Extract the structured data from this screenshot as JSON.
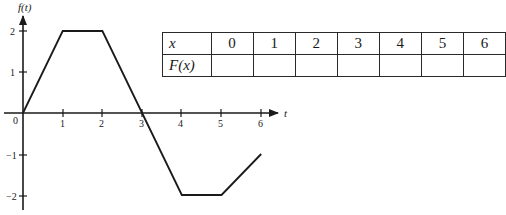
{
  "chart_data": {
    "type": "line",
    "title": "",
    "xlabel": "t",
    "ylabel": "f(t)",
    "x": [
      0,
      1,
      2,
      3,
      4,
      5,
      6
    ],
    "values": [
      0,
      2,
      2,
      0,
      -2,
      -2,
      -1
    ],
    "series": [
      {
        "name": "f(t)",
        "x": [
          0,
          1,
          2,
          3,
          4,
          5,
          6
        ],
        "values": [
          0,
          2,
          2,
          0,
          -2,
          -2,
          -1
        ]
      }
    ],
    "xlim": [
      0,
      6
    ],
    "ylim": [
      -2,
      2
    ],
    "x_ticks": [
      "0",
      "1",
      "2",
      "3",
      "4",
      "5",
      "6"
    ],
    "y_ticks": [
      "2",
      "1",
      "-1",
      "-2"
    ],
    "grid": false,
    "legend": null
  },
  "graph": {
    "y_axis_label": "f(t)",
    "x_axis_label": "t",
    "origin_label": "0",
    "x_tick_labels": [
      "1",
      "2",
      "3",
      "4",
      "5",
      "6"
    ],
    "y_tick_labels": {
      "p2": "2",
      "p1": "1",
      "n1": "−1",
      "n2": "−2"
    }
  },
  "table": {
    "row1_header": "x",
    "row2_header": "F(x)",
    "columns": [
      "0",
      "1",
      "2",
      "3",
      "4",
      "5",
      "6"
    ],
    "row2_values": [
      "",
      "",
      "",
      "",
      "",
      "",
      ""
    ]
  }
}
